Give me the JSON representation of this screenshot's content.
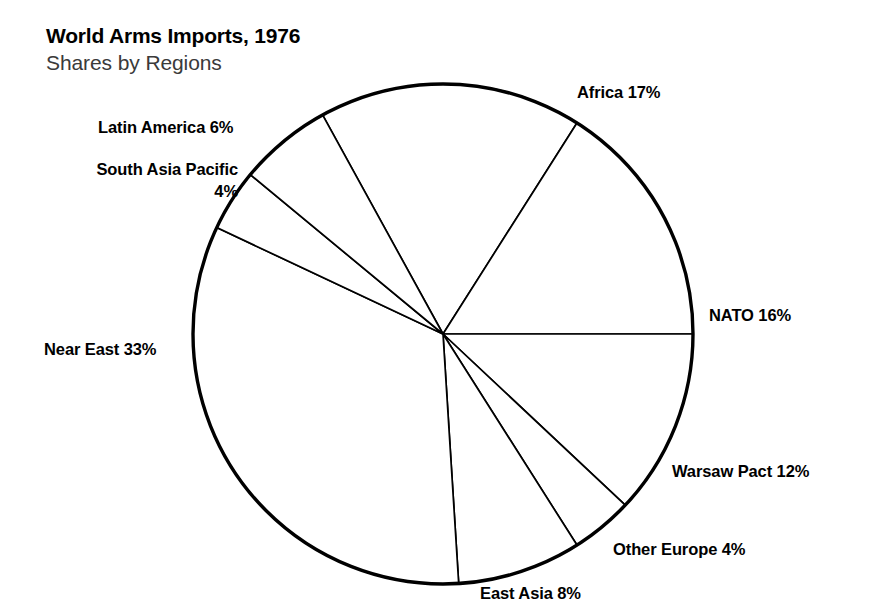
{
  "header": {
    "title": "World Arms Imports, 1976",
    "subtitle": "Shares by Regions"
  },
  "chart_data": {
    "type": "pie",
    "title": "World Arms Imports, 1976",
    "subtitle": "Shares by Regions",
    "xlabel": "",
    "ylabel": "",
    "units": "percent",
    "legend_position": "none",
    "grid": false,
    "labels_outside": true,
    "start_angle_deg": -28.8,
    "direction": "clockwise",
    "categories": [
      "Africa",
      "NATO",
      "Warsaw Pact",
      "Other Europe",
      "East Asia",
      "Near East",
      "South Asia Pacific",
      "Latin America"
    ],
    "values": [
      17,
      16,
      12,
      4,
      8,
      33,
      4,
      6
    ],
    "total": 100,
    "slices": [
      {
        "name": "Africa",
        "value": 17,
        "label": "Africa 17%"
      },
      {
        "name": "NATO",
        "value": 16,
        "label": "NATO 16%"
      },
      {
        "name": "Warsaw Pact",
        "value": 12,
        "label": "Warsaw Pact 12%"
      },
      {
        "name": "Other Europe",
        "value": 4,
        "label": "Other Europe 4%"
      },
      {
        "name": "East Asia",
        "value": 8,
        "label": "East Asia 8%"
      },
      {
        "name": "Near East",
        "value": 33,
        "label": "Near East 33%"
      },
      {
        "name": "South Asia Pacific",
        "value": 4,
        "label_line1": "South Asia Pacific",
        "label_line2": "4%"
      },
      {
        "name": "Latin America",
        "value": 6,
        "label": "Latin America 6%"
      }
    ],
    "colors": {
      "slice_fill": "#ffffff",
      "slice_stroke": "#000000",
      "outline": "#000000",
      "background": "#ffffff",
      "title_text": "#000000",
      "subtitle_text": "#3a3a3a"
    }
  },
  "geometry": {
    "center_x": 443,
    "center_y": 334,
    "radius": 250,
    "outline_width": 3.4,
    "divider_width": 1.7
  }
}
